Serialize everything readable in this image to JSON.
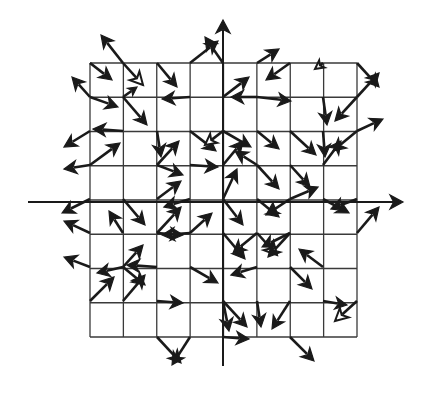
{
  "figure": {
    "title": "",
    "kind": "vector-field-quiver-plot",
    "canvas": {
      "width": 421,
      "height": 394,
      "background": "#ffffff"
    }
  },
  "style": {
    "stroke_color": "#1a1a1a",
    "grid_color": "#3a3a3a",
    "axis_color": "#1a1a1a",
    "fill_solid": "#1a1a1a",
    "fill_hollow": "#ffffff",
    "grid_line_width": 1.3,
    "axis_line_width": 2.0,
    "arrow_line_width": 2.6
  },
  "chart_data": {
    "type": "scatter",
    "subtype": "quiver",
    "title": "",
    "xlabel": "",
    "ylabel": "",
    "grid": true,
    "legend": "none",
    "axes": {
      "x_axis": {
        "y_px": 202,
        "x_start_px": 28,
        "x_end_px": 403,
        "arrow": "right"
      },
      "y_axis": {
        "x_px": 223,
        "y_start_px": 366,
        "y_end_px": 20,
        "arrow": "up"
      }
    },
    "grid_box": {
      "left_px": 90,
      "top_px": 63,
      "right_px": 357,
      "bottom_px": 337,
      "columns": 8,
      "rows": 8,
      "cell_width_px": 33.375,
      "cell_height_px": 34.25
    },
    "xlim": [
      -4,
      4
    ],
    "ylim": [
      -4,
      4
    ],
    "arrows": [
      {
        "x": 90,
        "y": 63,
        "dx": 22,
        "dy": 17,
        "fill": "solid"
      },
      {
        "x": 123,
        "y": 63,
        "dx": -22,
        "dy": -28,
        "fill": "solid"
      },
      {
        "x": 123,
        "y": 63,
        "dx": 20,
        "dy": 22,
        "fill": "hollow"
      },
      {
        "x": 157,
        "y": 63,
        "dx": 20,
        "dy": 24,
        "fill": "solid"
      },
      {
        "x": 190,
        "y": 63,
        "dx": 28,
        "dy": -22,
        "fill": "solid"
      },
      {
        "x": 223,
        "y": 63,
        "dx": -18,
        "dy": -26,
        "fill": "solid"
      },
      {
        "x": 257,
        "y": 63,
        "dx": 22,
        "dy": -14,
        "fill": "solid"
      },
      {
        "x": 290,
        "y": 63,
        "dx": -24,
        "dy": 17,
        "fill": "solid"
      },
      {
        "x": 323,
        "y": 63,
        "dx": -8,
        "dy": 6,
        "fill": "hollow"
      },
      {
        "x": 357,
        "y": 63,
        "dx": 22,
        "dy": 24,
        "fill": "solid"
      },
      {
        "x": 90,
        "y": 97,
        "dx": -18,
        "dy": -20,
        "fill": "solid"
      },
      {
        "x": 90,
        "y": 97,
        "dx": 28,
        "dy": 10,
        "fill": "solid"
      },
      {
        "x": 123,
        "y": 97,
        "dx": 24,
        "dy": 28,
        "fill": "solid"
      },
      {
        "x": 123,
        "y": 97,
        "dx": 14,
        "dy": -10,
        "fill": "solid"
      },
      {
        "x": 190,
        "y": 97,
        "dx": -28,
        "dy": 2,
        "fill": "solid"
      },
      {
        "x": 223,
        "y": 97,
        "dx": 26,
        "dy": -20,
        "fill": "solid"
      },
      {
        "x": 257,
        "y": 97,
        "dx": -26,
        "dy": 0,
        "fill": "solid"
      },
      {
        "x": 257,
        "y": 97,
        "dx": 34,
        "dy": 4,
        "fill": "solid"
      },
      {
        "x": 323,
        "y": 97,
        "dx": 4,
        "dy": 28,
        "fill": "solid"
      },
      {
        "x": 357,
        "y": 97,
        "dx": -22,
        "dy": 24,
        "fill": "solid"
      },
      {
        "x": 357,
        "y": 97,
        "dx": 22,
        "dy": -24,
        "fill": "solid"
      },
      {
        "x": 123,
        "y": 131,
        "dx": -30,
        "dy": -2,
        "fill": "solid"
      },
      {
        "x": 90,
        "y": 131,
        "dx": -26,
        "dy": 16,
        "fill": "solid"
      },
      {
        "x": 157,
        "y": 131,
        "dx": 4,
        "dy": 26,
        "fill": "solid"
      },
      {
        "x": 190,
        "y": 131,
        "dx": 26,
        "dy": 20,
        "fill": "solid"
      },
      {
        "x": 223,
        "y": 131,
        "dx": -18,
        "dy": 14,
        "fill": "hollow"
      },
      {
        "x": 223,
        "y": 131,
        "dx": 28,
        "dy": 16,
        "fill": "solid"
      },
      {
        "x": 257,
        "y": 131,
        "dx": 22,
        "dy": 18,
        "fill": "solid"
      },
      {
        "x": 290,
        "y": 131,
        "dx": 26,
        "dy": 24,
        "fill": "solid"
      },
      {
        "x": 323,
        "y": 131,
        "dx": 2,
        "dy": 26,
        "fill": "solid"
      },
      {
        "x": 357,
        "y": 131,
        "dx": -24,
        "dy": 20,
        "fill": "solid"
      },
      {
        "x": 357,
        "y": 131,
        "dx": 26,
        "dy": -12,
        "fill": "solid"
      },
      {
        "x": 90,
        "y": 165,
        "dx": -26,
        "dy": 4,
        "fill": "solid"
      },
      {
        "x": 90,
        "y": 165,
        "dx": 30,
        "dy": -22,
        "fill": "solid"
      },
      {
        "x": 157,
        "y": 165,
        "dx": 26,
        "dy": 10,
        "fill": "solid"
      },
      {
        "x": 157,
        "y": 165,
        "dx": 22,
        "dy": -24,
        "fill": "solid"
      },
      {
        "x": 190,
        "y": 165,
        "dx": 28,
        "dy": 2,
        "fill": "solid"
      },
      {
        "x": 223,
        "y": 165,
        "dx": 20,
        "dy": -24,
        "fill": "solid"
      },
      {
        "x": 257,
        "y": 165,
        "dx": -22,
        "dy": -14,
        "fill": "solid"
      },
      {
        "x": 257,
        "y": 165,
        "dx": 22,
        "dy": 24,
        "fill": "solid"
      },
      {
        "x": 290,
        "y": 165,
        "dx": 20,
        "dy": 22,
        "fill": "solid"
      },
      {
        "x": 323,
        "y": 165,
        "dx": 18,
        "dy": -24,
        "fill": "solid"
      },
      {
        "x": 90,
        "y": 199,
        "dx": -28,
        "dy": 14,
        "fill": "solid"
      },
      {
        "x": 123,
        "y": 199,
        "dx": 22,
        "dy": 26,
        "fill": "solid"
      },
      {
        "x": 157,
        "y": 199,
        "dx": 24,
        "dy": -18,
        "fill": "solid"
      },
      {
        "x": 190,
        "y": 199,
        "dx": -26,
        "dy": 8,
        "fill": "solid"
      },
      {
        "x": 223,
        "y": 199,
        "dx": 14,
        "dy": -30,
        "fill": "solid"
      },
      {
        "x": 223,
        "y": 199,
        "dx": 20,
        "dy": 26,
        "fill": "solid"
      },
      {
        "x": 257,
        "y": 199,
        "dx": 22,
        "dy": 18,
        "fill": "solid"
      },
      {
        "x": 290,
        "y": 199,
        "dx": -24,
        "dy": 16,
        "fill": "solid"
      },
      {
        "x": 290,
        "y": 199,
        "dx": 28,
        "dy": -12,
        "fill": "solid"
      },
      {
        "x": 323,
        "y": 199,
        "dx": 26,
        "dy": 14,
        "fill": "solid"
      },
      {
        "x": 357,
        "y": 199,
        "dx": -26,
        "dy": 10,
        "fill": "solid"
      },
      {
        "x": 90,
        "y": 233,
        "dx": -26,
        "dy": -12,
        "fill": "solid"
      },
      {
        "x": 123,
        "y": 233,
        "dx": -14,
        "dy": -22,
        "fill": "solid"
      },
      {
        "x": 157,
        "y": 233,
        "dx": 24,
        "dy": -26,
        "fill": "solid"
      },
      {
        "x": 157,
        "y": 233,
        "dx": 26,
        "dy": 2,
        "fill": "solid"
      },
      {
        "x": 190,
        "y": 233,
        "dx": 22,
        "dy": -20,
        "fill": "solid"
      },
      {
        "x": 190,
        "y": 233,
        "dx": -28,
        "dy": 2,
        "fill": "solid"
      },
      {
        "x": 223,
        "y": 233,
        "dx": 22,
        "dy": 26,
        "fill": "solid"
      },
      {
        "x": 257,
        "y": 233,
        "dx": -24,
        "dy": 20,
        "fill": "solid"
      },
      {
        "x": 257,
        "y": 233,
        "dx": 20,
        "dy": 22,
        "fill": "hollow"
      },
      {
        "x": 290,
        "y": 233,
        "dx": -28,
        "dy": 14,
        "fill": "solid"
      },
      {
        "x": 290,
        "y": 233,
        "dx": -22,
        "dy": 24,
        "fill": "solid"
      },
      {
        "x": 357,
        "y": 233,
        "dx": 22,
        "dy": -26,
        "fill": "solid"
      },
      {
        "x": 90,
        "y": 267,
        "dx": -26,
        "dy": -10,
        "fill": "solid"
      },
      {
        "x": 123,
        "y": 267,
        "dx": 20,
        "dy": -22,
        "fill": "solid"
      },
      {
        "x": 123,
        "y": 267,
        "dx": -26,
        "dy": 6,
        "fill": "solid"
      },
      {
        "x": 123,
        "y": 267,
        "dx": 22,
        "dy": 18,
        "fill": "solid"
      },
      {
        "x": 157,
        "y": 267,
        "dx": -30,
        "dy": -2,
        "fill": "solid"
      },
      {
        "x": 190,
        "y": 267,
        "dx": 28,
        "dy": 16,
        "fill": "solid"
      },
      {
        "x": 257,
        "y": 267,
        "dx": -26,
        "dy": 8,
        "fill": "solid"
      },
      {
        "x": 290,
        "y": 267,
        "dx": 22,
        "dy": 22,
        "fill": "solid"
      },
      {
        "x": 323,
        "y": 267,
        "dx": -24,
        "dy": -18,
        "fill": "solid"
      },
      {
        "x": 90,
        "y": 301,
        "dx": 24,
        "dy": -24,
        "fill": "solid"
      },
      {
        "x": 123,
        "y": 301,
        "dx": 22,
        "dy": -26,
        "fill": "solid"
      },
      {
        "x": 157,
        "y": 301,
        "dx": 26,
        "dy": 2,
        "fill": "solid"
      },
      {
        "x": 223,
        "y": 301,
        "dx": 6,
        "dy": 30,
        "fill": "solid"
      },
      {
        "x": 223,
        "y": 301,
        "dx": 24,
        "dy": 26,
        "fill": "solid"
      },
      {
        "x": 257,
        "y": 301,
        "dx": 4,
        "dy": 26,
        "fill": "solid"
      },
      {
        "x": 290,
        "y": 301,
        "dx": -18,
        "dy": 28,
        "fill": "solid"
      },
      {
        "x": 323,
        "y": 301,
        "dx": 24,
        "dy": 4,
        "fill": "solid"
      },
      {
        "x": 357,
        "y": 301,
        "dx": -22,
        "dy": 20,
        "fill": "hollow"
      },
      {
        "x": 157,
        "y": 337,
        "dx": 24,
        "dy": 26,
        "fill": "solid"
      },
      {
        "x": 190,
        "y": 337,
        "dx": -18,
        "dy": 28,
        "fill": "solid"
      },
      {
        "x": 223,
        "y": 337,
        "dx": 26,
        "dy": 2,
        "fill": "solid"
      },
      {
        "x": 290,
        "y": 337,
        "dx": 24,
        "dy": 24,
        "fill": "solid"
      }
    ]
  }
}
